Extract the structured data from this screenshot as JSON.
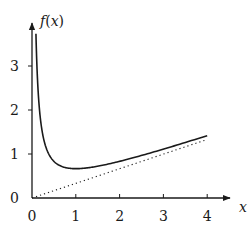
{
  "chart_data": {
    "type": "line",
    "title": "",
    "xlabel": "x",
    "ylabel": "f(x)",
    "xlim": [
      0,
      4.4
    ],
    "ylim": [
      0,
      3.9
    ],
    "x_ticks": [
      "0",
      "1",
      "2",
      "3",
      "4"
    ],
    "y_ticks": [
      "0",
      "1",
      "2",
      "3"
    ],
    "grid": false,
    "legend": null,
    "series": [
      {
        "name": "f(x)",
        "style": "solid",
        "x": [
          0.09,
          0.1,
          0.15,
          0.2,
          0.3,
          0.4,
          0.5,
          0.7,
          1.0,
          1.5,
          2.0,
          2.5,
          3.0,
          3.5,
          4.0
        ],
        "values": [
          3.73,
          3.37,
          2.27,
          1.73,
          1.21,
          0.97,
          0.83,
          0.71,
          0.67,
          0.72,
          0.83,
          0.97,
          1.11,
          1.26,
          1.42
        ]
      },
      {
        "name": "asymptote y = x/3",
        "style": "dotted",
        "x": [
          0,
          4.0
        ],
        "values": [
          0,
          1.33
        ]
      }
    ]
  },
  "axes": {
    "x_label": "x",
    "y_label": "f(x)",
    "x_tick_labels": [
      "0",
      "1",
      "2",
      "3",
      "4"
    ],
    "y_tick_labels": [
      "0",
      "1",
      "2",
      "3"
    ]
  }
}
